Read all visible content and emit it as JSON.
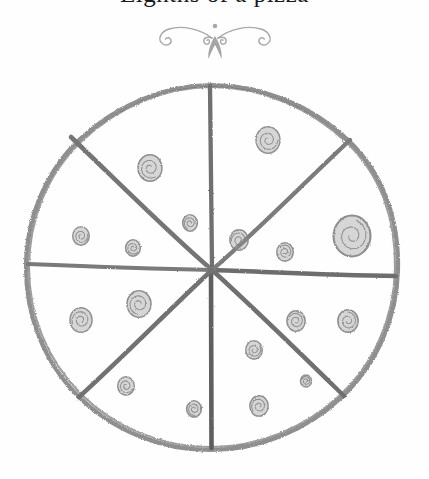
{
  "page": {
    "title_fragment": "Eighths of a pizza",
    "background_color": "#fefefe",
    "width": 429,
    "height": 479
  },
  "ornament": {
    "name": "fleuron-divider",
    "color": "#a8a8a8",
    "description": "symmetric scroll flourish with downward flame"
  },
  "drawing": {
    "name": "hand-drawn-pizza-eighths",
    "medium": "pencil sketch",
    "stroke_color": "#8a8a8a",
    "dark_stroke_color": "#6b6b6b",
    "topping_color": "#9a9a9a",
    "crust": {
      "center_x": 212,
      "center_y": 215,
      "radius": 186,
      "label": "pizza crust outline"
    },
    "slice_count": 8,
    "cut_lines": [
      {
        "label": "vertical-cut",
        "angle_deg": 90
      },
      {
        "label": "horizontal-cut",
        "angle_deg": 0
      },
      {
        "label": "diagonal-cut-ne-sw",
        "angle_deg": 45
      },
      {
        "label": "diagonal-cut-nw-se",
        "angle_deg": 135
      }
    ],
    "toppings": [
      {
        "id": "pepperoni-1",
        "cx": 268,
        "cy": 84,
        "r": 13,
        "sector": "upper-right"
      },
      {
        "id": "pepperoni-2",
        "cx": 150,
        "cy": 112,
        "r": 13,
        "sector": "upper-left"
      },
      {
        "id": "pepperoni-3",
        "cx": 190,
        "cy": 167,
        "r": 8,
        "sector": "upper-left"
      },
      {
        "id": "pepperoni-4",
        "cx": 239,
        "cy": 184,
        "r": 10,
        "sector": "upper-right"
      },
      {
        "id": "pepperoni-5",
        "cx": 285,
        "cy": 196,
        "r": 9,
        "sector": "right-upper"
      },
      {
        "id": "pepperoni-6",
        "cx": 352,
        "cy": 180,
        "r": 20,
        "sector": "right-upper"
      },
      {
        "id": "pepperoni-7",
        "cx": 81,
        "cy": 180,
        "r": 9,
        "sector": "left-upper"
      },
      {
        "id": "pepperoni-8",
        "cx": 133,
        "cy": 192,
        "r": 8,
        "sector": "left-upper"
      },
      {
        "id": "pepperoni-9",
        "cx": 139,
        "cy": 248,
        "r": 13,
        "sector": "left-lower"
      },
      {
        "id": "pepperoni-10",
        "cx": 81,
        "cy": 264,
        "r": 12,
        "sector": "left-lower"
      },
      {
        "id": "pepperoni-11",
        "cx": 296,
        "cy": 265,
        "r": 10,
        "sector": "right-lower"
      },
      {
        "id": "pepperoni-12",
        "cx": 348,
        "cy": 265,
        "r": 11,
        "sector": "right-lower"
      },
      {
        "id": "pepperoni-13",
        "cx": 254,
        "cy": 294,
        "r": 9,
        "sector": "lower-right"
      },
      {
        "id": "pepperoni-14",
        "cx": 126,
        "cy": 330,
        "r": 9,
        "sector": "lower-left"
      },
      {
        "id": "pepperoni-15",
        "cx": 194,
        "cy": 353,
        "r": 8,
        "sector": "lower-left"
      },
      {
        "id": "pepperoni-16",
        "cx": 259,
        "cy": 350,
        "r": 10,
        "sector": "lower-right"
      },
      {
        "id": "pepperoni-17",
        "cx": 306,
        "cy": 325,
        "r": 6,
        "sector": "lower-right"
      }
    ]
  }
}
